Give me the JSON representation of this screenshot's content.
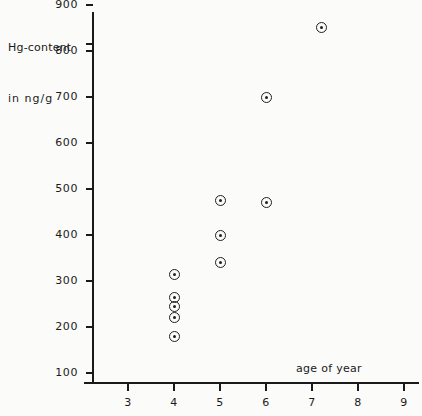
{
  "chart_data": {
    "type": "scatter",
    "title": "",
    "ylabel": "Hg-content",
    "ylabel_line2": "in ng/g",
    "xlabel": "age of year",
    "xlim": [
      2.5,
      9.4
    ],
    "ylim": [
      0,
      975
    ],
    "grid": false,
    "legend": null,
    "x_ticks": [
      3,
      4,
      5,
      6,
      7,
      8,
      9
    ],
    "x_tick_labels": [
      "3",
      "4",
      "5",
      "6",
      "7",
      "8",
      "9"
    ],
    "y_ticks": [
      100,
      200,
      300,
      400,
      500,
      600,
      700,
      800,
      900
    ],
    "y_tick_labels": [
      "100",
      "200",
      "300",
      "400",
      "500",
      "600",
      "700",
      "800",
      "900"
    ],
    "marker_style": "open-circle-with-center-dot",
    "series": [
      {
        "name": "Hg-content vs age",
        "points": [
          {
            "x": 4,
            "y": 315
          },
          {
            "x": 4,
            "y": 265
          },
          {
            "x": 4,
            "y": 245
          },
          {
            "x": 4,
            "y": 220
          },
          {
            "x": 4,
            "y": 180
          },
          {
            "x": 5,
            "y": 475
          },
          {
            "x": 5,
            "y": 400
          },
          {
            "x": 5,
            "y": 340
          },
          {
            "x": 6,
            "y": 700
          },
          {
            "x": 6,
            "y": 470
          },
          {
            "x": 7.2,
            "y": 852
          }
        ]
      }
    ]
  },
  "colors": {
    "ink": "#1a1a1a",
    "paper": "#fbfbf9"
  }
}
